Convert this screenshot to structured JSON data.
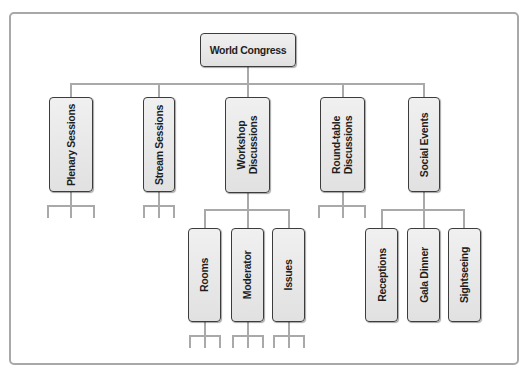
{
  "diagram": {
    "root": {
      "label": "World Congress"
    },
    "level1": [
      {
        "label": "Plenary Sessions"
      },
      {
        "label": "Stream Sessions"
      },
      {
        "label": "Workshop\nDiscussions",
        "line1": "Workshop",
        "line2": "Discussions"
      },
      {
        "label": "Round-table\nDiscussions",
        "line1": "Round-table",
        "line2": "Discussions"
      },
      {
        "label": "Social Events"
      }
    ],
    "workshop_children": [
      {
        "label": "Rooms"
      },
      {
        "label": "Moderator"
      },
      {
        "label": "Issues"
      }
    ],
    "social_children": [
      {
        "label": "Receptions"
      },
      {
        "label": "Gala Dinner"
      },
      {
        "label": "Sightseeing"
      }
    ]
  },
  "colors": {
    "connector": "#a9a9a9",
    "node_border": "#3c3c3c",
    "node_fill": "#e6e6e6",
    "frame": "#a8a8a8"
  }
}
